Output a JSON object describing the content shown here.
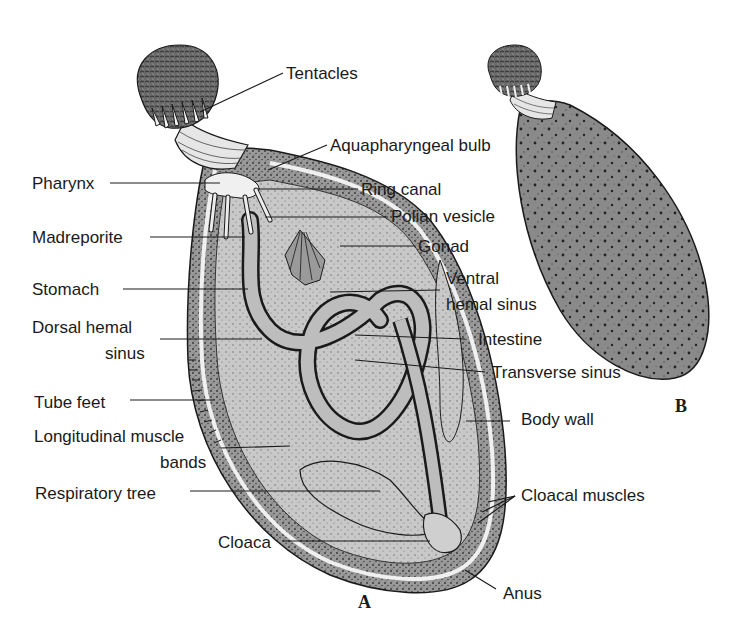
{
  "figure": {
    "panels": [
      {
        "id": "A",
        "label": "A",
        "description": "Internal anatomy (dissected view)"
      },
      {
        "id": "B",
        "label": "B",
        "description": "External view"
      }
    ],
    "labels_left": [
      {
        "text": "Pharynx",
        "x": 32,
        "y": 174
      },
      {
        "text": "Madreporite",
        "x": 32,
        "y": 228
      },
      {
        "text": "Stomach",
        "x": 32,
        "y": 280
      },
      {
        "text": "Dorsal hemal",
        "x": 32,
        "y": 318
      },
      {
        "text": "sinus",
        "x": 105,
        "y": 344
      },
      {
        "text": "Tube feet",
        "x": 34,
        "y": 393
      },
      {
        "text": "Longitudinal muscle",
        "x": 34,
        "y": 427
      },
      {
        "text": "bands",
        "x": 160,
        "y": 453
      },
      {
        "text": "Respiratory tree",
        "x": 35,
        "y": 484
      },
      {
        "text": "Cloaca",
        "x": 218,
        "y": 533
      }
    ],
    "labels_right": [
      {
        "text": "Tentacles",
        "x": 286,
        "y": 64
      },
      {
        "text": "Aquapharyngeal bulb",
        "x": 330,
        "y": 136
      },
      {
        "text": "Ring canal",
        "x": 361,
        "y": 180
      },
      {
        "text": "Polian vesicle",
        "x": 391,
        "y": 207
      },
      {
        "text": "Gonad",
        "x": 418,
        "y": 237
      },
      {
        "text": "Ventral",
        "x": 446,
        "y": 269
      },
      {
        "text": "hemal sinus",
        "x": 446,
        "y": 295
      },
      {
        "text": "Intestine",
        "x": 478,
        "y": 330
      },
      {
        "text": "Transverse sinus",
        "x": 492,
        "y": 363
      },
      {
        "text": "Body wall",
        "x": 521,
        "y": 410
      },
      {
        "text": "Cloacal muscles",
        "x": 521,
        "y": 486
      },
      {
        "text": "Anus",
        "x": 503,
        "y": 584
      }
    ],
    "panel_label_positions": {
      "A": {
        "x": 358,
        "y": 592
      },
      "B": {
        "x": 675,
        "y": 396
      }
    },
    "colors": {
      "ink": "#1a1a1a",
      "body_fill": "#8c8c8c",
      "organ_fill": "#bdbdbd",
      "light_fill": "#d6d6d6",
      "background": "#ffffff"
    }
  }
}
